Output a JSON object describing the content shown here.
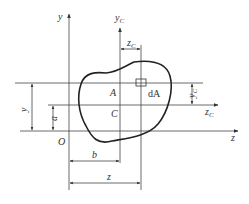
{
  "diagram": {
    "type": "parallel-axis-theorem-figure",
    "axes": {
      "y": "y",
      "z": "z",
      "yc": "y",
      "yc_sub": "C",
      "zc": "z",
      "zc_sub": "C"
    },
    "points": {
      "origin": "O",
      "centroid": "C",
      "point_a": "A",
      "element": "dA"
    },
    "dimensions": {
      "y": "y",
      "a": "a",
      "b": "b",
      "z": "z",
      "zc": "z",
      "zc_sub": "C",
      "yc": "y",
      "yc_sub": "C"
    }
  }
}
